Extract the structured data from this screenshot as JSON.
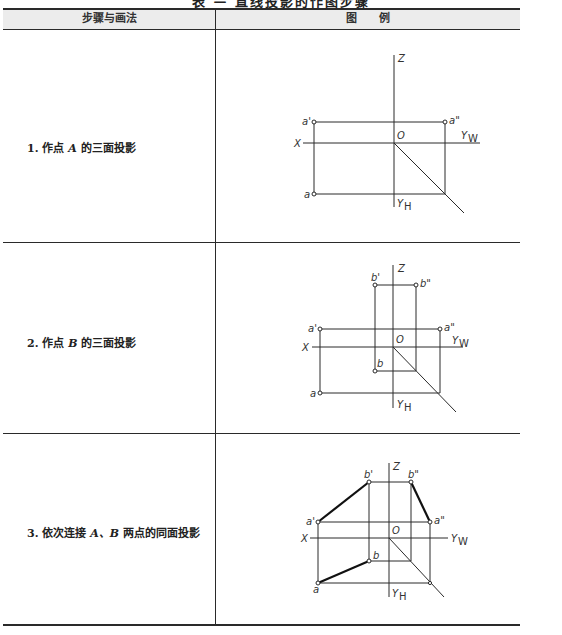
{
  "document": {
    "title": "表 — 直线投影的作图步骤",
    "columns": [
      {
        "label": "步骤与画法"
      },
      {
        "label": "图　　例"
      }
    ],
    "rows": [
      {
        "step": "1. 作点 A 的三面投影",
        "number": "1.",
        "text_before": "作点 ",
        "point": "A",
        "text_after": " 的三面投影"
      },
      {
        "step": "2. 作点 B 的三面投影",
        "number": "2.",
        "text_before": "作点 ",
        "point": "B",
        "text_after": " 的三面投影"
      },
      {
        "step": "3. 依次连接 A、B 两点的同面投影",
        "number": "3.",
        "text_before": "依次连接 ",
        "point": "A、B",
        "text_after": " 两点的同面投影"
      }
    ]
  },
  "diagram_labels": {
    "z_axis": "Z",
    "x_axis": "X",
    "origin": "O",
    "yw": "Y",
    "yw_sub": "W",
    "yh": "Y",
    "yh_sub": "H",
    "a_front": "a'",
    "a_side": "a\"",
    "a_top": "a",
    "b_front": "b'",
    "b_side": "b\"",
    "b_top": "b"
  },
  "colors": {
    "line": "#2a2a2a",
    "header_bg": "#ececec",
    "bold_line": "#111111"
  }
}
